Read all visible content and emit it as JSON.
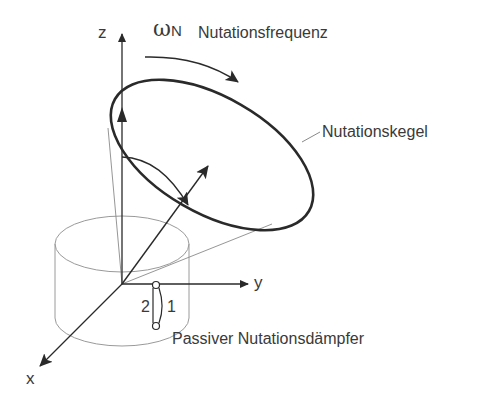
{
  "diagram": {
    "axes": {
      "x": "x",
      "y": "y",
      "z": "z"
    },
    "frequency": {
      "symbol": "ω",
      "subscript": "N",
      "label": "Nutationsfrequenz"
    },
    "cone_label": "Nutationskegel",
    "damper": {
      "label": "Passiver Nutationsdämpfer",
      "position_1": "1",
      "position_2": "2"
    },
    "colors": {
      "line": "#2a2a2a",
      "thin_line": "#8a8a8a",
      "text": "#3a3a3a"
    }
  }
}
